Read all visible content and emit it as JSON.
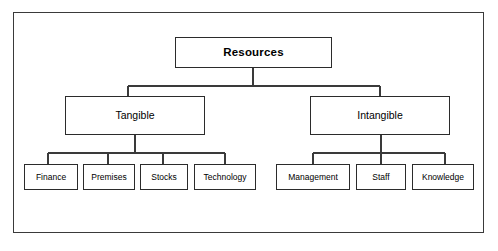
{
  "diagram": {
    "title_node": "Resources",
    "type": "hierarchy-tree",
    "background_color": "#ffffff",
    "frame_color": "#3a3a3a",
    "box_border_color": "#2b2b2b",
    "connector_color": "#3a3a3a",
    "text_color": "#000000"
  },
  "nodes": {
    "root": {
      "label": "Resources",
      "x": 175,
      "y": 37,
      "w": 157,
      "h": 31
    },
    "branches": [
      {
        "label": "Tangible",
        "x": 65,
        "y": 96,
        "w": 140,
        "h": 39
      },
      {
        "label": "Intangible",
        "x": 310,
        "y": 96,
        "w": 140,
        "h": 39
      }
    ],
    "leaves": [
      {
        "label": "Finance",
        "x": 24,
        "y": 164,
        "w": 54,
        "h": 26,
        "parent": "Tangible"
      },
      {
        "label": "Premises",
        "x": 83,
        "y": 164,
        "w": 52,
        "h": 26,
        "parent": "Tangible"
      },
      {
        "label": "Stocks",
        "x": 140,
        "y": 164,
        "w": 48,
        "h": 26,
        "parent": "Tangible"
      },
      {
        "label": "Technology",
        "x": 194,
        "y": 164,
        "w": 62,
        "h": 26,
        "parent": "Tangible"
      },
      {
        "label": "Management",
        "x": 276,
        "y": 164,
        "w": 74,
        "h": 26,
        "parent": "Intangible"
      },
      {
        "label": "Staff",
        "x": 356,
        "y": 164,
        "w": 50,
        "h": 26,
        "parent": "Intangible"
      },
      {
        "label": "Knowledge",
        "x": 412,
        "y": 164,
        "w": 62,
        "h": 26,
        "parent": "Intangible"
      }
    ]
  },
  "connectors": {
    "root_to_branches": {
      "stem_x": 253,
      "stem_top": 68,
      "bus_y": 86,
      "bus_left": 128,
      "bus_right": 380,
      "drops": [
        {
          "x": 128,
          "to_y": 96
        },
        {
          "x": 380,
          "to_y": 96
        }
      ]
    },
    "tangible_to_leaves": {
      "stem_x": 135,
      "stem_top": 135,
      "bus_y": 153,
      "bus_left": 48,
      "bus_right": 225,
      "drops": [
        {
          "x": 48,
          "to_y": 164
        },
        {
          "x": 108,
          "to_y": 164
        },
        {
          "x": 163,
          "to_y": 164
        },
        {
          "x": 225,
          "to_y": 164
        }
      ]
    },
    "intangible_to_leaves": {
      "stem_x": 381,
      "stem_top": 135,
      "bus_y": 153,
      "bus_left": 313,
      "bus_right": 445,
      "drops": [
        {
          "x": 313,
          "to_y": 164
        },
        {
          "x": 381,
          "to_y": 164
        },
        {
          "x": 445,
          "to_y": 164
        }
      ]
    }
  }
}
